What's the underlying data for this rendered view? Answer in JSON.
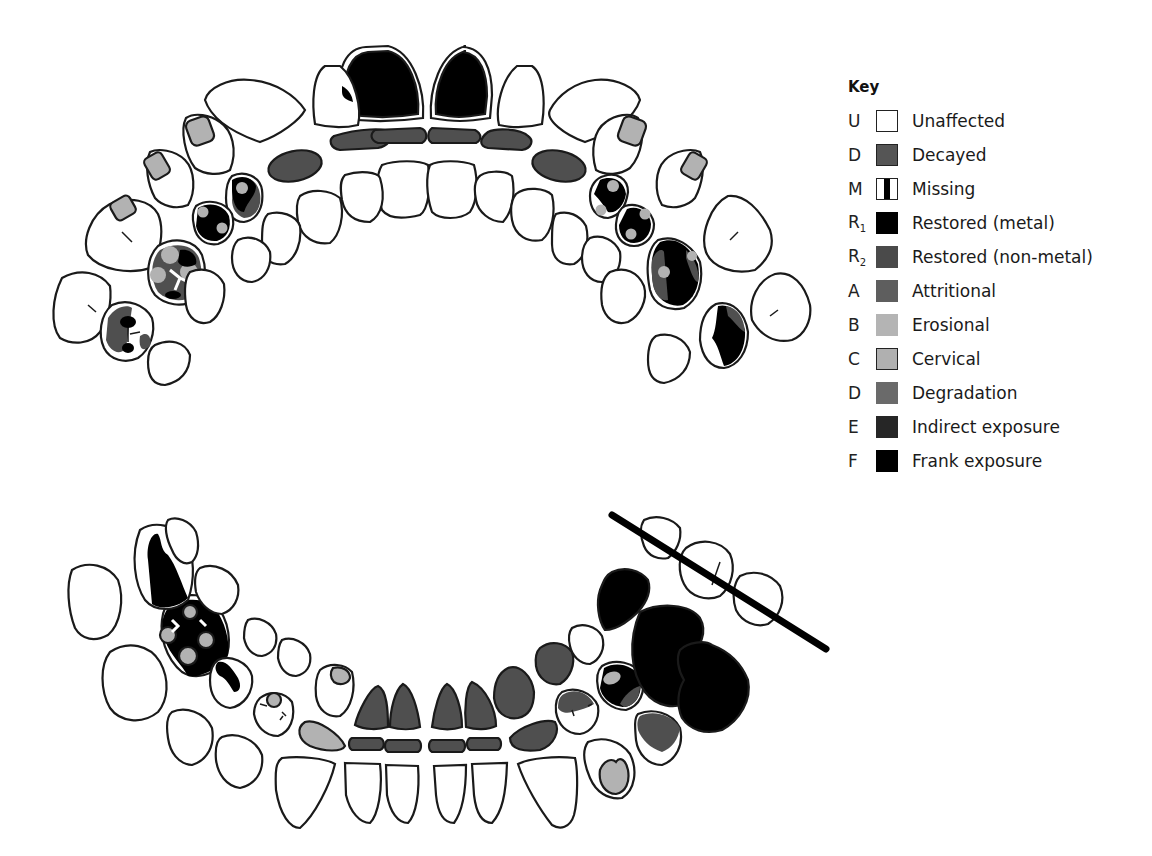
{
  "key": {
    "title": "Key",
    "items": [
      {
        "code": "U",
        "sub": "",
        "label": "Unaffected",
        "fill": "#ffffff",
        "border": "#222222",
        "pattern": "plain"
      },
      {
        "code": "D",
        "sub": "",
        "label": "Decayed",
        "fill": "#555555",
        "border": "#222222",
        "pattern": "plain"
      },
      {
        "code": "M",
        "sub": "",
        "label": "Missing",
        "fill": "#ffffff",
        "border": "#222222",
        "pattern": "bar"
      },
      {
        "code": "R",
        "sub": "1",
        "label": "Restored (metal)",
        "fill": "#000000",
        "border": "#000000",
        "pattern": "plain"
      },
      {
        "code": "R",
        "sub": "2",
        "label": "Restored (non-metal)",
        "fill": "#4a4a4a",
        "border": "#4a4a4a",
        "pattern": "plain"
      },
      {
        "code": "A",
        "sub": "",
        "label": "Attritional",
        "fill": "#5e5e5e",
        "border": "#5e5e5e",
        "pattern": "plain"
      },
      {
        "code": "B",
        "sub": "",
        "label": "Erosional",
        "fill": "#b4b4b4",
        "border": "#b4b4b4",
        "pattern": "plain"
      },
      {
        "code": "C",
        "sub": "",
        "label": "Cervical",
        "fill": "#b0b0b0",
        "border": "#222222",
        "pattern": "plain"
      },
      {
        "code": "D",
        "sub": "",
        "label": "Degradation",
        "fill": "#6a6a6a",
        "border": "#6a6a6a",
        "pattern": "plain"
      },
      {
        "code": "E",
        "sub": "",
        "label": "Indirect exposure",
        "fill": "#262626",
        "border": "#262626",
        "pattern": "plain"
      },
      {
        "code": "F",
        "sub": "",
        "label": "Frank exposure",
        "fill": "#000000",
        "border": "#000000",
        "pattern": "plain"
      }
    ]
  },
  "colors": {
    "outline": "#1a1a1a",
    "unaffected": "#ffffff",
    "decayed": "#555555",
    "restored_metal": "#000000",
    "restored_nonmetal": "#4a4a4a",
    "attritional": "#5e5e5e",
    "erosional": "#b4b4b4",
    "cervical": "#b0b0b0",
    "degradation": "#6a6a6a",
    "indirect_exposure": "#262626",
    "frank_exposure": "#000000"
  },
  "arches": {
    "upper": {
      "label": "Upper arch"
    },
    "lower": {
      "label": "Lower arch",
      "missing_bar": true
    }
  }
}
